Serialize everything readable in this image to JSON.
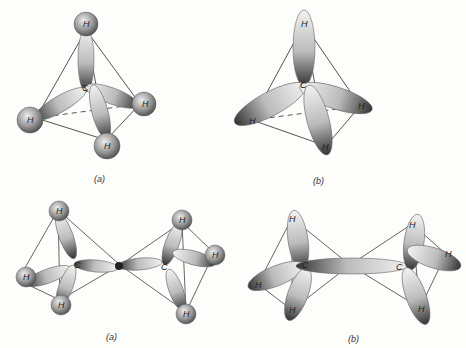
{
  "figures": [
    {
      "id": "methane-a",
      "caption": "(a)",
      "center_atom": "C",
      "atoms": [
        "H",
        "H",
        "H",
        "H"
      ]
    },
    {
      "id": "methane-b",
      "caption": "(b)",
      "center_atom": "C",
      "atoms": [
        "H",
        "H",
        "H",
        "H"
      ]
    },
    {
      "id": "ethane-a",
      "caption": "(a)",
      "carbons": [
        "C",
        "C"
      ],
      "atoms": [
        "H",
        "H",
        "H",
        "H",
        "H",
        "H"
      ]
    },
    {
      "id": "ethane-b",
      "caption": "(b)",
      "carbons": [
        "C",
        "C"
      ],
      "atoms": [
        "H",
        "H",
        "H",
        "H",
        "H",
        "H"
      ]
    }
  ],
  "colors": {
    "background": "#fdfdfb",
    "line": "#555555",
    "lobe_fill": "#d8d8d8",
    "lobe_dark": "#333333",
    "sphere": "#9a9a9a"
  }
}
